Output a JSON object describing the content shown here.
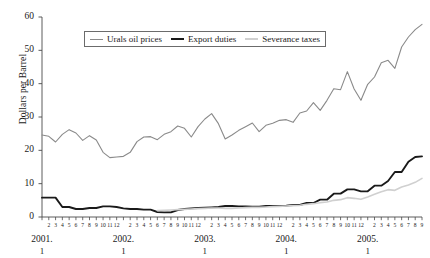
{
  "chart_data": {
    "type": "line",
    "title": "",
    "xlabel": "",
    "ylabel": "Dollars per Barrel",
    "ylim": [
      0,
      60
    ],
    "yticks": [
      0,
      10,
      20,
      30,
      40,
      50,
      60
    ],
    "grid": false,
    "legend_position": "top-center",
    "x": [
      "2001.1",
      "2001.2",
      "2001.3",
      "2001.4",
      "2001.5",
      "2001.6",
      "2001.7",
      "2001.8",
      "2001.9",
      "2001.10",
      "2001.11",
      "2001.12",
      "2002.1",
      "2002.2",
      "2002.3",
      "2002.4",
      "2002.5",
      "2002.6",
      "2002.7",
      "2002.8",
      "2002.9",
      "2002.10",
      "2002.11",
      "2002.12",
      "2003.1",
      "2003.2",
      "2003.3",
      "2003.4",
      "2003.5",
      "2003.6",
      "2003.7",
      "2003.8",
      "2003.9",
      "2003.10",
      "2003.11",
      "2003.12",
      "2004.1",
      "2004.2",
      "2004.3",
      "2004.4",
      "2004.5",
      "2004.6",
      "2004.7",
      "2004.8",
      "2004.9",
      "2004.10",
      "2004.11",
      "2004.12",
      "2005.1",
      "2005.2",
      "2005.3",
      "2005.4",
      "2005.5",
      "2005.6",
      "2005.7",
      "2005.8",
      "2005.9"
    ],
    "month_tick_labels": [
      "2",
      "3",
      "4",
      "5",
      "6",
      "7",
      "8",
      "9",
      "10",
      "11",
      "12",
      "2",
      "3",
      "4",
      "5",
      "6",
      "7",
      "8",
      "9",
      "10",
      "11",
      "12",
      "2",
      "3",
      "4",
      "5",
      "6",
      "7",
      "8",
      "9",
      "10",
      "11",
      "12",
      "2",
      "3",
      "4",
      "5",
      "6",
      "7",
      "8",
      "9",
      "10",
      "11",
      "12",
      "2",
      "3",
      "4",
      "5",
      "6",
      "7",
      "8",
      "9"
    ],
    "year_labels": [
      "2001.",
      "2002.",
      "2003.",
      "2004.",
      "2005."
    ],
    "year_sub_label": "1",
    "series": [
      {
        "name": "Urals oil prices",
        "color": "#8a8a8a",
        "width": 1.1,
        "values": [
          24.6,
          24.2,
          22.5,
          24.8,
          26.2,
          25.2,
          23.0,
          24.4,
          23.1,
          19.4,
          17.8,
          18.0,
          18.2,
          19.4,
          22.6,
          24.0,
          24.1,
          23.2,
          24.8,
          25.6,
          27.3,
          26.6,
          24.0,
          27.1,
          29.4,
          31.0,
          28.0,
          23.4,
          24.6,
          26.0,
          27.1,
          28.2,
          25.6,
          27.5,
          28.1,
          29.0,
          29.2,
          28.4,
          31.2,
          31.8,
          34.3,
          32.0,
          35.0,
          38.5,
          38.2,
          43.6,
          38.4,
          35.0,
          39.8,
          42.0,
          46.3,
          47.0,
          44.6,
          51.0,
          54.0,
          56.2,
          57.8
        ]
      },
      {
        "name": "Export duties",
        "color": "#1a1a1a",
        "width": 1.9,
        "values": [
          5.8,
          5.8,
          5.8,
          3.0,
          3.0,
          2.4,
          2.4,
          2.7,
          2.7,
          3.2,
          3.2,
          3.0,
          2.6,
          2.4,
          2.4,
          2.2,
          2.2,
          1.5,
          1.4,
          1.4,
          2.1,
          2.4,
          2.6,
          2.7,
          2.8,
          2.9,
          3.0,
          3.3,
          3.3,
          3.2,
          3.2,
          3.1,
          3.1,
          3.3,
          3.3,
          3.3,
          3.4,
          3.6,
          3.6,
          4.2,
          4.2,
          5.2,
          5.2,
          7.0,
          7.0,
          8.3,
          8.3,
          7.7,
          7.7,
          9.4,
          9.4,
          10.8,
          13.5,
          13.5,
          16.6,
          18.0,
          18.2
        ]
      },
      {
        "name": "Severance taxes",
        "color": "#d0d0d0",
        "width": 1.6,
        "values": [
          null,
          null,
          null,
          null,
          null,
          null,
          null,
          null,
          null,
          null,
          null,
          null,
          null,
          null,
          null,
          null,
          null,
          1.9,
          2.0,
          2.1,
          2.2,
          2.3,
          2.4,
          2.5,
          2.6,
          2.7,
          2.7,
          2.6,
          2.6,
          2.7,
          2.8,
          2.9,
          2.9,
          3.0,
          3.1,
          3.2,
          3.3,
          3.4,
          3.5,
          3.8,
          4.0,
          4.3,
          4.5,
          5.0,
          5.2,
          5.8,
          5.6,
          5.3,
          6.0,
          6.8,
          7.6,
          8.2,
          8.0,
          9.0,
          9.6,
          10.4,
          11.6
        ]
      }
    ]
  }
}
